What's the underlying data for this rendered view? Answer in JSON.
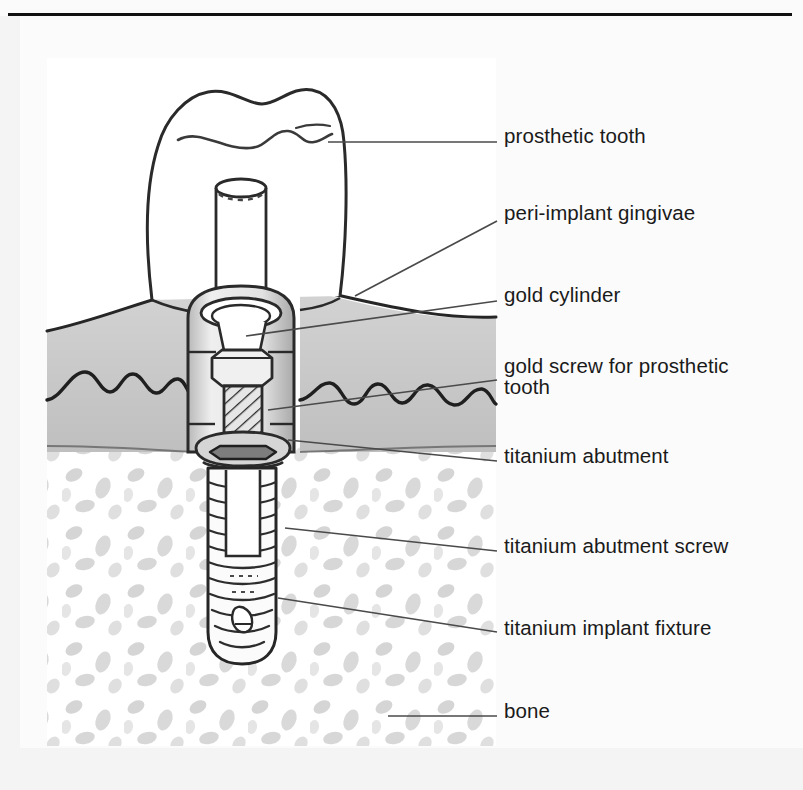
{
  "figure": {
    "kind": "line-drawing",
    "panel_background": "#ffffff",
    "page_background": "#fbfbfb",
    "ink_color": "#1a1a1a",
    "gingiva_shade": "#c9c9c9",
    "bone_stipple_shade": "#bdbdbd",
    "metal_shade": "#d8d8d8"
  },
  "top_rule": {
    "color": "#111111"
  },
  "labels": [
    {
      "id": "prosthetic-tooth",
      "text": "prosthetic tooth",
      "top": 126,
      "leader": "horizontal"
    },
    {
      "id": "peri-implant-gingivae",
      "text": "peri-implant gingivae",
      "top": 203,
      "leader": "diagonal"
    },
    {
      "id": "gold-cylinder",
      "text": "gold cylinder",
      "top": 285,
      "leader": "diagonal"
    },
    {
      "id": "gold-screw-for-prosthetic-tooth",
      "text": "gold screw for prosthetic\ntooth",
      "top": 356,
      "leader": "diagonal"
    },
    {
      "id": "titanium-abutment",
      "text": "titanium abutment",
      "top": 446,
      "leader": "diagonal"
    },
    {
      "id": "titanium-abutment-screw",
      "text": "titanium abutment screw",
      "top": 536,
      "leader": "diagonal"
    },
    {
      "id": "titanium-implant-fixture",
      "text": "titanium implant fixture",
      "top": 618,
      "leader": "diagonal"
    },
    {
      "id": "bone",
      "text": "bone",
      "top": 701,
      "leader": "horizontal"
    }
  ]
}
